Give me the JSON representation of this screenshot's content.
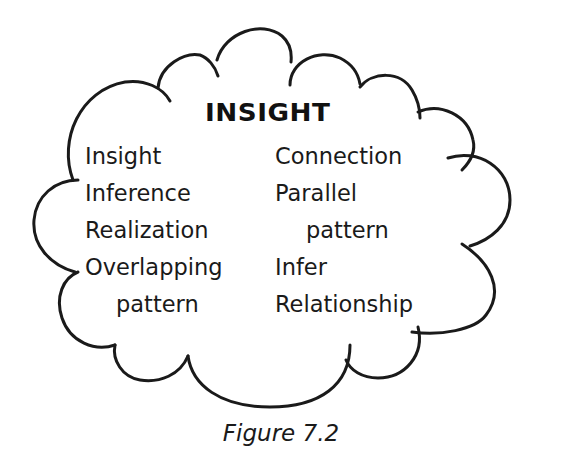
{
  "figure": {
    "heading": "INSIGHT",
    "shape": "thought-cloud",
    "left_column": [
      {
        "text": "Insight",
        "indent": false
      },
      {
        "text": "Inference",
        "indent": false
      },
      {
        "text": "Realization",
        "indent": false
      },
      {
        "text": "Overlapping",
        "indent": false
      },
      {
        "text": "pattern",
        "indent": true
      }
    ],
    "right_column": [
      {
        "text": "Connection",
        "indent": false
      },
      {
        "text": "Parallel",
        "indent": false
      },
      {
        "text": "pattern",
        "indent": true
      },
      {
        "text": "Infer",
        "indent": false
      },
      {
        "text": "Relationship",
        "indent": false
      }
    ],
    "caption": "Figure 7.2",
    "colors": {
      "stroke": "#1a1a1a",
      "text": "#1a1a1a",
      "background": "#ffffff"
    }
  }
}
